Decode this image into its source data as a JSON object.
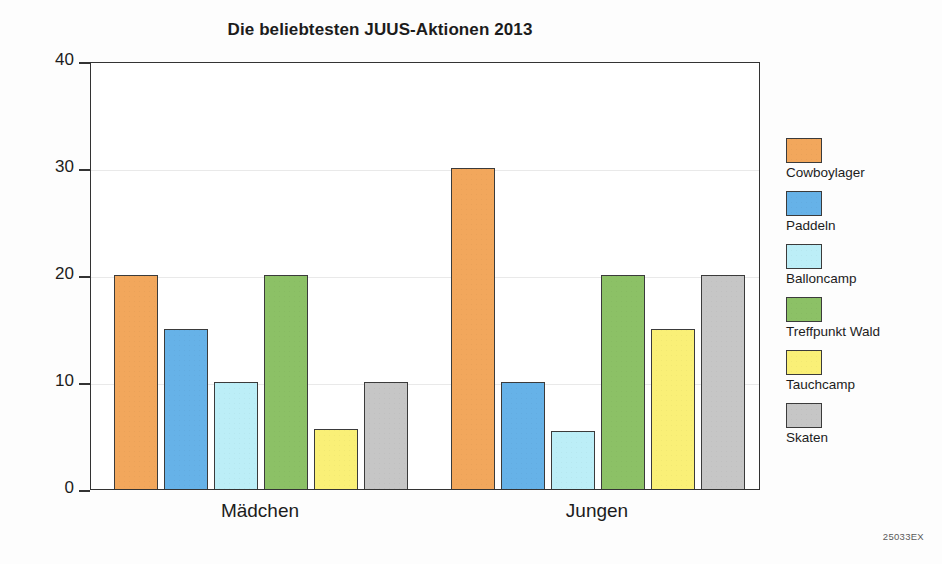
{
  "chart_data": {
    "type": "bar",
    "title": "Die beliebtesten JUUS-Aktionen 2013",
    "xlabel": "",
    "ylabel": "",
    "ylim": [
      0,
      40
    ],
    "yticks": [
      0,
      10,
      20,
      30,
      40
    ],
    "grid": true,
    "legend_position": "right",
    "categories": [
      "Mädchen",
      "Jungen"
    ],
    "series": [
      {
        "name": "Cowboylager",
        "color": "#F2A75C",
        "values": [
          20,
          30
        ]
      },
      {
        "name": "Paddeln",
        "color": "#66B2E8",
        "values": [
          15,
          10
        ]
      },
      {
        "name": "Balloncamp",
        "color": "#BCEEF7",
        "values": [
          10,
          5.4
        ]
      },
      {
        "name": "Treffpunkt Wald",
        "color": "#8CC166",
        "values": [
          20,
          20
        ]
      },
      {
        "name": "Tauchcamp",
        "color": "#FAF077",
        "values": [
          5.6,
          15
        ]
      },
      {
        "name": "Skaten",
        "color": "#C6C6C6",
        "values": [
          10,
          20
        ]
      }
    ]
  },
  "annotations": {
    "corner_code": "25033EX"
  }
}
